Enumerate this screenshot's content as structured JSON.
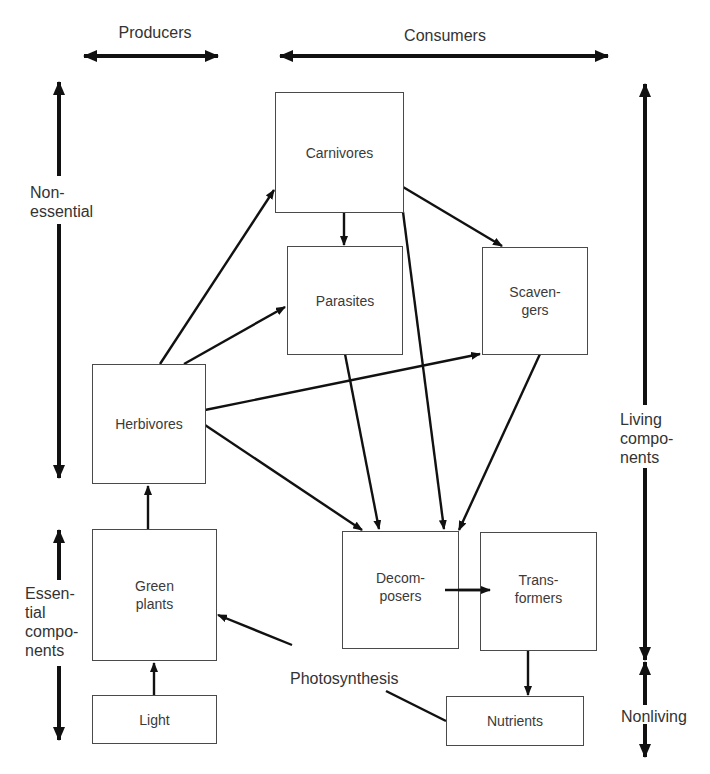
{
  "axes": {
    "producers": "Producers",
    "consumers": "Consumers",
    "nonessential": "Non-\nessential",
    "essential": "Essen-\ntial\ncompo-\nnents",
    "living": "Living\ncompo-\nnents",
    "nonliving": "Nonliving"
  },
  "nodes": {
    "carnivores": "Carnivores",
    "parasites": "Parasites",
    "scavengers": "Scaven-\ngers",
    "herbivores": "Herbivores",
    "green_plants": "Green\nplants",
    "light": "Light",
    "decomposers": "Decom-\nposers",
    "transformers": "Trans-\nformers",
    "nutrients": "Nutrients"
  },
  "edge_labels": {
    "photosynthesis": "Photosynthesis"
  },
  "edges": [
    {
      "from": "light",
      "to": "green_plants"
    },
    {
      "from": "green_plants",
      "to": "herbivores"
    },
    {
      "from": "herbivores",
      "to": "carnivores"
    },
    {
      "from": "herbivores",
      "to": "parasites"
    },
    {
      "from": "herbivores",
      "to": "scavengers"
    },
    {
      "from": "herbivores",
      "to": "decomposers"
    },
    {
      "from": "carnivores",
      "to": "parasites"
    },
    {
      "from": "carnivores",
      "to": "scavengers"
    },
    {
      "from": "carnivores",
      "to": "decomposers"
    },
    {
      "from": "parasites",
      "to": "decomposers"
    },
    {
      "from": "scavengers",
      "to": "decomposers"
    },
    {
      "from": "decomposers",
      "to": "transformers"
    },
    {
      "from": "transformers",
      "to": "nutrients"
    },
    {
      "from": "nutrients",
      "to": "green_plants",
      "label": "Photosynthesis"
    }
  ],
  "colors": {
    "line": "#111111",
    "box_border": "#4a4a4a",
    "text": "#333333",
    "background": "#ffffff"
  }
}
